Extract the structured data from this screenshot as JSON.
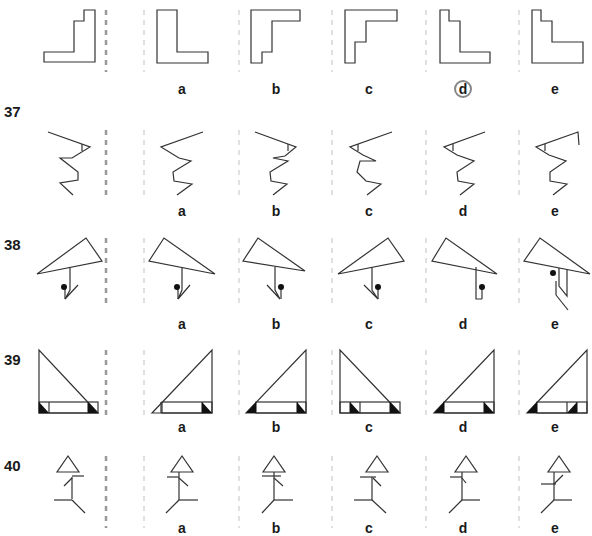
{
  "worksheet": {
    "title": "Mirror image puzzles",
    "colors": {
      "stroke": "#333333",
      "divider_main": "#999999",
      "divider_option": "#cccccc",
      "answer_ring": "#888888"
    },
    "option_letters": [
      "a",
      "b",
      "c",
      "d",
      "e"
    ],
    "questions": [
      {
        "number": "",
        "label_y": 0,
        "answer": "d",
        "row_top": 0
      },
      {
        "number": "37",
        "label_y": 105,
        "answer": "",
        "row_top": 98
      },
      {
        "number": "38",
        "label_y": 237,
        "answer": "",
        "row_top": 230
      },
      {
        "number": "39",
        "label_y": 352,
        "answer": "",
        "row_top": 345
      },
      {
        "number": "40",
        "label_y": 458,
        "answer": "",
        "row_top": 452
      }
    ],
    "labels": [
      {
        "text": "a",
        "x": 170,
        "y": 78
      },
      {
        "text": "b",
        "x": 264,
        "y": 78
      },
      {
        "text": "c",
        "x": 357,
        "y": 78
      },
      {
        "text": "d",
        "x": 450,
        "y": 78
      },
      {
        "text": "e",
        "x": 543,
        "y": 78
      },
      {
        "text": "a",
        "x": 170,
        "y": 203
      },
      {
        "text": "b",
        "x": 264,
        "y": 203
      },
      {
        "text": "c",
        "x": 357,
        "y": 203
      },
      {
        "text": "d",
        "x": 450,
        "y": 203
      },
      {
        "text": "e",
        "x": 543,
        "y": 203
      },
      {
        "text": "a",
        "x": 170,
        "y": 316
      },
      {
        "text": "b",
        "x": 264,
        "y": 316
      },
      {
        "text": "c",
        "x": 357,
        "y": 316
      },
      {
        "text": "d",
        "x": 450,
        "y": 316
      },
      {
        "text": "e",
        "x": 543,
        "y": 316
      },
      {
        "text": "a",
        "x": 170,
        "y": 421
      },
      {
        "text": "b",
        "x": 264,
        "y": 421
      },
      {
        "text": "c",
        "x": 357,
        "y": 421
      },
      {
        "text": "d",
        "x": 450,
        "y": 421
      },
      {
        "text": "e",
        "x": 543,
        "y": 421
      },
      {
        "text": "a",
        "x": 170,
        "y": 520
      },
      {
        "text": "b",
        "x": 264,
        "y": 520
      },
      {
        "text": "c",
        "x": 357,
        "y": 520
      },
      {
        "text": "d",
        "x": 450,
        "y": 520
      },
      {
        "text": "e",
        "x": 543,
        "y": 520
      }
    ],
    "answer_ring": {
      "x": 453,
      "y": 80
    }
  }
}
